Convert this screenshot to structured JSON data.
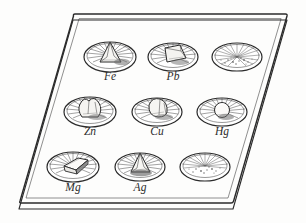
{
  "figure": {
    "medium": "pen-and-ink line drawing",
    "background_color": "#fdfdfc",
    "ink_color": "#2b2b2b"
  },
  "tray": {
    "name": "specimen-tray",
    "shape": "parallelogram-in-perspective",
    "has_rim": true,
    "has_thickness_edge": true,
    "corners": [
      {
        "x": 73,
        "y": 14
      },
      {
        "x": 287,
        "y": 14
      },
      {
        "x": 233,
        "y": 203
      },
      {
        "x": 19,
        "y": 203
      }
    ],
    "edge_offset_px": 6
  },
  "grid": {
    "rows": 3,
    "columns": 3,
    "row_x_shift_px": -15,
    "row_spacing_px": 55
  },
  "dishes": [
    {
      "id": "dish-fe",
      "label": "Fe",
      "row": 1,
      "col": 1,
      "cx": 110,
      "cy": 57,
      "rx": 26,
      "ry": 15,
      "content": "lump",
      "content_shape": "cone",
      "labelled": true,
      "label_x": 110,
      "label_y": 80
    },
    {
      "id": "dish-pb",
      "label": "Pb",
      "row": 1,
      "col": 2,
      "cx": 173,
      "cy": 57,
      "rx": 25,
      "ry": 14,
      "content": "lump",
      "content_shape": "block",
      "labelled": true,
      "label_x": 173,
      "label_y": 80
    },
    {
      "id": "dish-unlabelled-1",
      "label": "",
      "row": 1,
      "col": 3,
      "cx": 237,
      "cy": 57,
      "rx": 25,
      "ry": 14,
      "content": "powder",
      "content_shape": "granules",
      "labelled": false,
      "label_x": 237,
      "label_y": 80
    },
    {
      "id": "dish-zn",
      "label": "Zn",
      "row": 2,
      "col": 1,
      "cx": 90,
      "cy": 112,
      "rx": 26,
      "ry": 15,
      "content": "lump",
      "content_shape": "nugget",
      "labelled": true,
      "label_x": 90,
      "label_y": 135
    },
    {
      "id": "dish-cu",
      "label": "Cu",
      "row": 2,
      "col": 2,
      "cx": 157,
      "cy": 112,
      "rx": 25,
      "ry": 14,
      "content": "lump",
      "content_shape": "nugget",
      "labelled": true,
      "label_x": 157,
      "label_y": 135
    },
    {
      "id": "dish-hg",
      "label": "Hg",
      "row": 2,
      "col": 3,
      "cx": 222,
      "cy": 112,
      "rx": 25,
      "ry": 14,
      "content": "droplet",
      "content_shape": "bead",
      "labelled": true,
      "label_x": 222,
      "label_y": 135
    },
    {
      "id": "dish-mg",
      "label": "Mg",
      "row": 3,
      "col": 1,
      "cx": 73,
      "cy": 167,
      "rx": 26,
      "ry": 15,
      "content": "ribbon",
      "content_shape": "folded-slab",
      "labelled": true,
      "label_x": 73,
      "label_y": 191
    },
    {
      "id": "dish-ag",
      "label": "Ag",
      "row": 3,
      "col": 2,
      "cx": 140,
      "cy": 167,
      "rx": 25,
      "ry": 14,
      "content": "lump",
      "content_shape": "cone",
      "labelled": true,
      "label_x": 140,
      "label_y": 191
    },
    {
      "id": "dish-unlabelled-2",
      "label": "",
      "row": 3,
      "col": 3,
      "cx": 205,
      "cy": 167,
      "rx": 25,
      "ry": 14,
      "content": "powder",
      "content_shape": "granules",
      "labelled": false,
      "label_x": 205,
      "label_y": 191
    }
  ]
}
